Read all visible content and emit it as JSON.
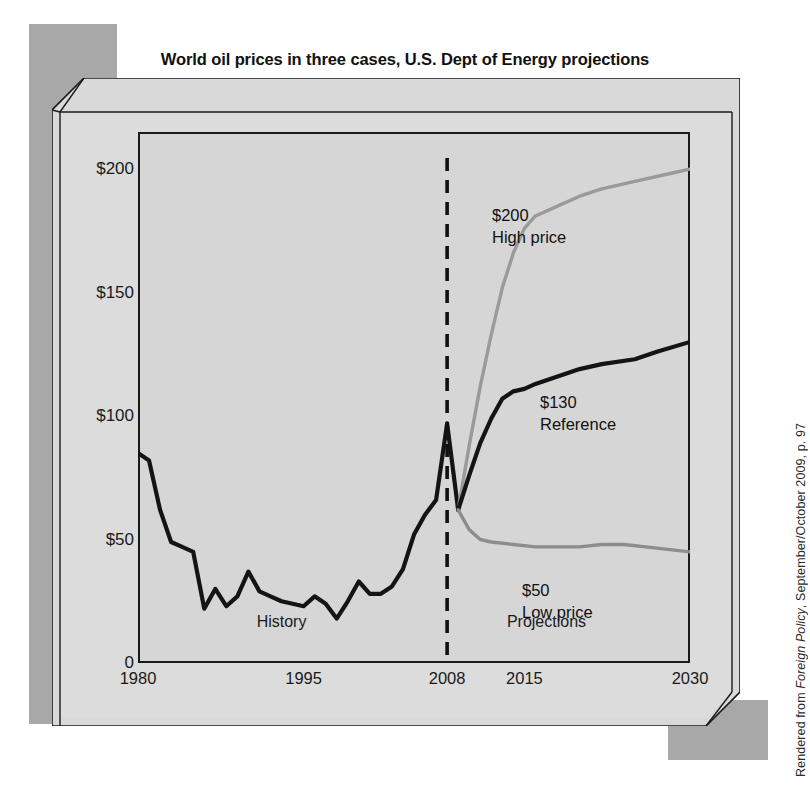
{
  "title": "World oil prices in three cases, U.S. Dept of Energy projections",
  "credit": {
    "prefix": "Rendered from ",
    "source": "Foreign Policy",
    "suffix": ", September/October 2009, p. 97"
  },
  "colors": {
    "history_line": "#141414",
    "reference_line": "#141414",
    "high_line": "#9a9a9a",
    "low_line": "#8d8d8d",
    "frame": "#1a1a1a",
    "plot_bg": "#d6d6d6",
    "slab": "#d9d9d9",
    "backdrop": "#a8a8a8",
    "text": "#1a1a1a"
  },
  "axes": {
    "y_ticks": [
      "$200",
      "$150",
      "$100",
      "$50",
      "0"
    ],
    "y_values": [
      200,
      150,
      100,
      50,
      0
    ],
    "x_ticks": [
      "1980",
      "1995",
      "2008",
      "2015",
      "2030"
    ],
    "x_values": [
      1980,
      1995,
      2008,
      2015,
      2030
    ]
  },
  "regions": [
    {
      "label": "History",
      "x": 1993
    },
    {
      "label": "Projections",
      "x": 2017
    }
  ],
  "divider": {
    "x": 2008,
    "style": "dashed"
  },
  "annotations": [
    {
      "name": "high",
      "value_label": "$200",
      "name_label": "High price",
      "x": 492,
      "y": 205
    },
    {
      "name": "reference",
      "value_label": "$130",
      "name_label": "Reference",
      "x": 540,
      "y": 392
    },
    {
      "name": "low",
      "value_label": "$50",
      "name_label": "Low price",
      "x": 522,
      "y": 580
    }
  ],
  "chart_data": {
    "type": "line",
    "title": "World oil prices in three cases, U.S. Dept of Energy projections",
    "xlabel": "",
    "ylabel": "Price per barrel (2008 dollars)",
    "xlim": [
      1980,
      2030
    ],
    "ylim": [
      0,
      215
    ],
    "grid": false,
    "legend": "inline-annotations",
    "x_tick_labels": [
      "1980",
      "1995",
      "2008",
      "2015",
      "2030"
    ],
    "y_tick_labels": [
      "$200",
      "$150",
      "$100",
      "$50",
      "0"
    ],
    "divider_x": 2008,
    "region_labels": [
      "History",
      "Projections"
    ],
    "series": [
      {
        "name": "History",
        "color": "#141414",
        "style": "solid",
        "x": [
          1980,
          1981,
          1982,
          1983,
          1984,
          1985,
          1986,
          1987,
          1988,
          1989,
          1990,
          1991,
          1992,
          1993,
          1994,
          1995,
          1996,
          1997,
          1998,
          1999,
          2000,
          2001,
          2002,
          2003,
          2004,
          2005,
          2006,
          2007,
          2008,
          2009
        ],
        "y": [
          85,
          82,
          62,
          49,
          47,
          45,
          22,
          30,
          23,
          27,
          37,
          29,
          27,
          25,
          24,
          23,
          27,
          24,
          18,
          25,
          33,
          28,
          28,
          31,
          38,
          52,
          60,
          66,
          97,
          62
        ]
      },
      {
        "name": "High price",
        "color": "#9a9a9a",
        "style": "solid",
        "x": [
          2009,
          2010,
          2011,
          2012,
          2013,
          2014,
          2015,
          2016,
          2018,
          2020,
          2022,
          2025,
          2028,
          2030
        ],
        "y": [
          62,
          88,
          112,
          133,
          152,
          166,
          176,
          181,
          185,
          189,
          192,
          195,
          198,
          200
        ]
      },
      {
        "name": "Reference",
        "color": "#141414",
        "style": "solid",
        "x": [
          2009,
          2010,
          2011,
          2012,
          2013,
          2014,
          2015,
          2016,
          2018,
          2020,
          2022,
          2025,
          2027,
          2030
        ],
        "y": [
          62,
          76,
          89,
          99,
          107,
          110,
          111,
          113,
          116,
          119,
          121,
          123,
          126,
          130
        ]
      },
      {
        "name": "Low price",
        "color": "#8d8d8d",
        "style": "solid",
        "x": [
          2009,
          2010,
          2011,
          2012,
          2014,
          2016,
          2018,
          2020,
          2022,
          2024,
          2026,
          2028,
          2030
        ],
        "y": [
          62,
          54,
          50,
          49,
          48,
          47,
          47,
          47,
          48,
          48,
          47,
          46,
          45
        ]
      }
    ],
    "endpoint_labels": [
      {
        "series": "High price",
        "label": "$200"
      },
      {
        "series": "Reference",
        "label": "$130"
      },
      {
        "series": "Low price",
        "label": "$50"
      }
    ]
  }
}
